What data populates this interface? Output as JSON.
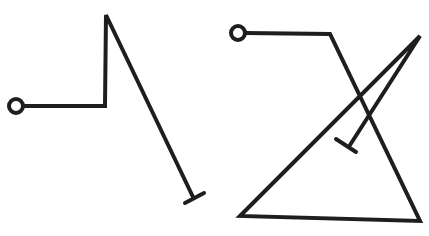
{
  "diagram": {
    "colors": {
      "background": "#ffffff",
      "stroke": "#1e1e1e"
    },
    "stroke_width": 4,
    "figures": [
      {
        "id": "left-figure",
        "start_circle": {
          "cx": 16,
          "cy": 106,
          "r": 7
        },
        "path_points": [
          [
            23,
            106
          ],
          [
            105,
            106
          ],
          [
            106,
            15
          ],
          [
            193,
            197
          ]
        ],
        "end_bar": {
          "x1": 185,
          "y1": 203,
          "x2": 204,
          "y2": 193
        }
      },
      {
        "id": "right-figure",
        "start_circle": {
          "cx": 238,
          "cy": 33,
          "r": 7
        },
        "path_points": [
          [
            245,
            33
          ],
          [
            330,
            34
          ],
          [
            420,
            221
          ],
          [
            240,
            216
          ],
          [
            420,
            36
          ],
          [
            350,
            145
          ]
        ],
        "end_bar": {
          "x1": 336,
          "y1": 139,
          "x2": 356,
          "y2": 152
        }
      }
    ]
  }
}
